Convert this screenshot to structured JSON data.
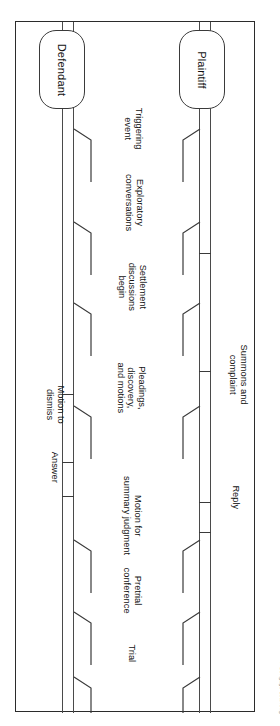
{
  "figure": {
    "type": "litigation-timeline-flowchart",
    "credit": "© Cengage Learning",
    "orientation": "rotated-90-clockwise"
  },
  "roles": [
    {
      "id": "plaintiff",
      "label": "Plaintiff",
      "side": "top-track"
    },
    {
      "id": "defendant",
      "label": "Defendant",
      "side": "bottom-track"
    }
  ],
  "events": [
    {
      "id": "triggering-event",
      "label": "Triggering\nevent"
    },
    {
      "id": "exploratory-conversations",
      "label": "Exploratory\nconversations"
    },
    {
      "id": "settlement-discussions",
      "label": "Settlement\ndiscussions\nbegin"
    },
    {
      "id": "pleadings-discovery",
      "label": "Pleadings,\ndiscovery,\nand motions"
    },
    {
      "id": "motion-summary-judgment",
      "label": "Motion for\nsummary judgment"
    },
    {
      "id": "pretrial-conference",
      "label": "Pretrial\nconference"
    },
    {
      "id": "trial",
      "label": "Trial"
    }
  ],
  "plaintiff_milestones": [
    {
      "id": "summons-and-complaint",
      "label": "Summons and\ncomplaint"
    },
    {
      "id": "reply",
      "label": "Reply"
    }
  ],
  "defendant_milestones": [
    {
      "id": "motion-to-dismiss",
      "label": "Motion to\ndismiss"
    },
    {
      "id": "answer",
      "label": "Answer"
    }
  ],
  "colors": {
    "line": "#3a3a3a",
    "frame": "#2b2b2b",
    "text": "#111111",
    "credit": "#8a8a8a",
    "background": "#ffffff"
  }
}
